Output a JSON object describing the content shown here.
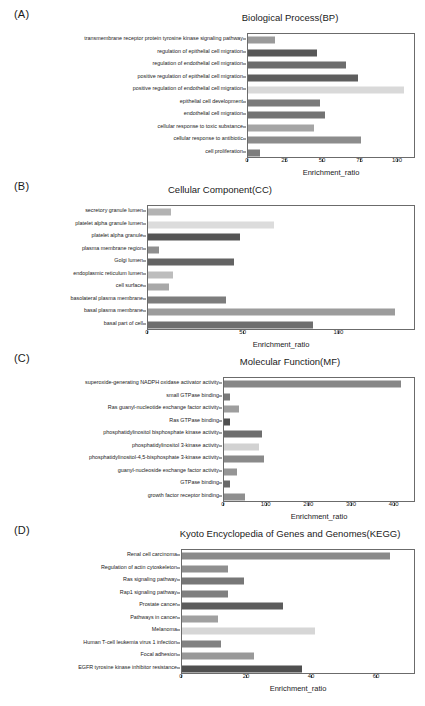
{
  "figure": {
    "axis_label": "Enrichment_ratio",
    "bar_height_px": 7
  },
  "panels": [
    {
      "tag": "(A)",
      "title": "Biological Process(BP)",
      "chart_data": {
        "type": "bar",
        "orientation": "horizontal",
        "title": "Biological Process(BP)",
        "xlabel": "Enrichment_ratio",
        "ylabel": "",
        "xlim": [
          0,
          112
        ],
        "xticks": [
          0,
          25,
          50,
          75,
          100
        ],
        "grid": false,
        "legend": "none",
        "categories": [
          "transmembrane receptor protein tyrosine kinase signaling pathway",
          "regulation of epithelial cell migration",
          "regulation of endothelial cell migration",
          "positive regulation of epithelial cell migration",
          "positive regulation of endothelial cell migration",
          "epithelial cell development",
          "endothelial cell migration",
          "cellular response to toxic substance",
          "cellular response to antibiotic",
          "cell proliferation"
        ],
        "values": [
          18,
          46,
          65,
          73,
          104,
          48,
          51,
          44,
          75,
          8
        ],
        "colors": [
          "#9a9a9a",
          "#575757",
          "#6d6d6d",
          "#5e5e5e",
          "#d9d9d9",
          "#7a7a7a",
          "#737373",
          "#a5a5a5",
          "#8c8c8c",
          "#7d7d7d"
        ]
      }
    },
    {
      "tag": "(B)",
      "title": "Cellular Component(CC)",
      "chart_data": {
        "type": "bar",
        "orientation": "horizontal",
        "title": "Cellular Component(CC)",
        "xlabel": "Enrichment_ratio",
        "ylabel": "",
        "xlim": [
          0,
          140
        ],
        "xticks": [
          0,
          50,
          100
        ],
        "grid": false,
        "legend": "none",
        "categories": [
          "secretory granule lumen",
          "platelet alpha granule lumen",
          "platelet alpha granule",
          "plasma membrane region",
          "Golgi lumen",
          "endoplasmic reticulum lumen",
          "cell surface",
          "basolateral plasma membrane",
          "basal plasma membrane",
          "basal part of cell"
        ],
        "values": [
          12,
          66,
          48,
          6,
          45,
          13,
          11,
          41,
          129,
          86
        ],
        "colors": [
          "#b3b3b3",
          "#dcdcdc",
          "#555555",
          "#8f8f8f",
          "#636363",
          "#bdbdbd",
          "#a8a8a8",
          "#7d7d7d",
          "#9c9c9c",
          "#6e6e6e"
        ]
      }
    },
    {
      "tag": "(C)",
      "title": "Molecular Function(MF)",
      "chart_data": {
        "type": "bar",
        "orientation": "horizontal",
        "title": "Molecular Function(MF)",
        "xlabel": "Enrichment_ratio",
        "ylabel": "",
        "xlim": [
          0,
          450
        ],
        "xticks": [
          0,
          100,
          200,
          300,
          400
        ],
        "grid": false,
        "legend": "none",
        "categories": [
          "superoxide-generating NADPH oxidase activator activity",
          "small GTPase binding",
          "Ras guanyl-nucleotide exchange factor activity",
          "Ras GTPase binding",
          "phosphatidylinositol bisphosphate kinase activity",
          "phosphatidylinositol 3-kinase activity",
          "phosphatidylinositol-4,5-bisphosphate 3-kinase activity",
          "guanyl-nucleoside exchange factor activity",
          "GTPase binding",
          "growth factor receptor binding"
        ],
        "values": [
          415,
          14,
          35,
          13,
          88,
          82,
          93,
          30,
          13,
          49
        ],
        "colors": [
          "#878787",
          "#7a7a7a",
          "#9e9e9e",
          "#4f4f4f",
          "#6e6e6e",
          "#d2d2d2",
          "#8a8a8a",
          "#959595",
          "#6a6a6a",
          "#8f8f8f"
        ]
      }
    },
    {
      "tag": "(D)",
      "title": "Kyoto Encyclopedia of Genes and Genomes(KEGG)",
      "chart_data": {
        "type": "bar",
        "orientation": "horizontal",
        "title": "Kyoto Encyclopedia of Genes and Genomes(KEGG)",
        "xlabel": "Enrichment_ratio",
        "ylabel": "",
        "xlim": [
          0,
          72
        ],
        "xticks": [
          0,
          20,
          40,
          60
        ],
        "grid": false,
        "legend": "none",
        "categories": [
          "Renal cell carcinoma",
          "Regulation of actin cytoskeleton",
          "Ras signaling pathway",
          "Rap1 signaling pathway",
          "Prostate cancer",
          "Pathways in cancer",
          "Melanoma",
          "Human T-cell leukemia virus 1 infection",
          "Focal adhesion",
          "EGFR tyrosine kinase inhibitor resistance"
        ],
        "values": [
          64,
          14,
          19,
          14,
          31,
          11,
          41,
          12,
          22,
          37
        ],
        "colors": [
          "#8a8a8a",
          "#8f8f8f",
          "#777777",
          "#808080",
          "#5c5c5c",
          "#a0a0a0",
          "#d6d6d6",
          "#828282",
          "#999999",
          "#4f4f4f"
        ]
      }
    }
  ]
}
